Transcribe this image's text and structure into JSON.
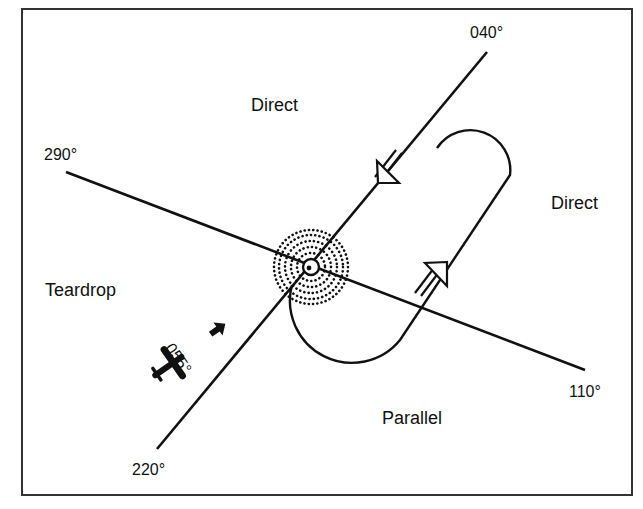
{
  "diagram": {
    "colors": {
      "stroke": "#111111",
      "background": "#ffffff",
      "frame": "#333333"
    },
    "fix": {
      "name": "holding-fix",
      "x": 311,
      "y": 267
    },
    "radials": [
      {
        "id": "inbound-course",
        "label": "040°",
        "from": [
          487,
          52
        ],
        "to": [
          157,
          449
        ]
      },
      {
        "id": "sector-divider",
        "label": "290°",
        "from": [
          66,
          172
        ],
        "to": [
          585,
          370
        ]
      }
    ],
    "bearing_labels": {
      "b040": "040°",
      "b290": "290°",
      "b110": "110°",
      "b220": "220°"
    },
    "entry_sectors": {
      "direct_top": "Direct",
      "direct_right": "Direct",
      "teardrop": "Teardrop",
      "parallel": "Parallel"
    },
    "aircraft": {
      "heading_label": "055°",
      "heading_deg": 55
    }
  }
}
